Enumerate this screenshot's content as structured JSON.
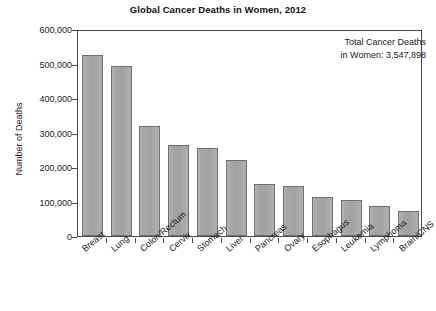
{
  "chart_data": {
    "type": "bar",
    "title": "Global Cancer Deaths in Women, 2012",
    "xlabel": "",
    "ylabel": "Number of Deaths",
    "ylim": [
      0,
      600000
    ],
    "grid": false,
    "legend": "none",
    "categories": [
      "Breast",
      "Lung",
      "Colon/Rectum",
      "Cervix",
      "Stomach",
      "Liver",
      "Pancreas",
      "Ovary",
      "Esophagus",
      "Leukemia",
      "Lymphoma",
      "Brain/CNS"
    ],
    "values": [
      524000,
      492000,
      318000,
      265000,
      254000,
      219000,
      152000,
      146000,
      113000,
      105000,
      88000,
      73000
    ],
    "ytick_labels": [
      "600,000",
      "500,000",
      "400,000",
      "300,000",
      "200,000",
      "100,000",
      "0"
    ],
    "ytick_values": [
      600000,
      500000,
      400000,
      300000,
      200000,
      100000,
      0
    ],
    "annotations": [
      {
        "line1": "Total Cancer Deaths",
        "line2": "in Women: 3,547,898",
        "position": "top-right"
      }
    ],
    "colors": {
      "bar_fill": "#a6a6a6",
      "bar_edge": "#6e6e6e",
      "axis": "#4a4a4a",
      "text": "#1a1a1a",
      "background": "#ffffff"
    }
  }
}
